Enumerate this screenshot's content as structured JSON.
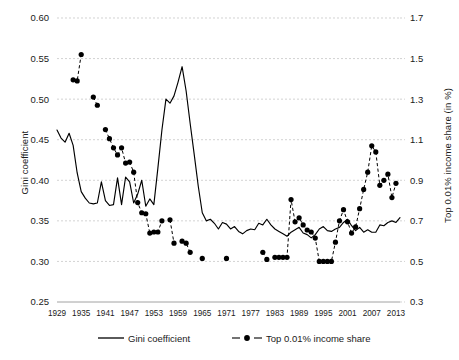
{
  "chart_data": {
    "type": "line",
    "title": "",
    "subtitle": "",
    "xlabel": "",
    "ylabel": "Gini coefficient",
    "ylabel_right": "Top 0.01% income share (in %)",
    "grid": true,
    "legend_position": "bottom",
    "xlim": [
      1929,
      2014
    ],
    "ylim": [
      0.25,
      0.6
    ],
    "ylim_right": [
      0.3,
      1.7
    ],
    "ytick_labels": [
      "0.25",
      "0.30",
      "0.35",
      "0.40",
      "0.45",
      "0.50",
      "0.55",
      "0.60"
    ],
    "ytick_values": [
      0.25,
      0.3,
      0.35,
      0.4,
      0.45,
      0.5,
      0.55,
      0.6
    ],
    "ytick_right_labels": [
      "0.3",
      "0.5",
      "0.7",
      "0.9",
      "1.1",
      "1.3",
      "1.5",
      "1.7"
    ],
    "ytick_right_values": [
      0.3,
      0.5,
      0.7,
      0.9,
      1.1,
      1.3,
      1.5,
      1.7
    ],
    "xtick_labels": [
      "1929",
      "1935",
      "1941",
      "1947",
      "1953",
      "1959",
      "1965",
      "1971",
      "1977",
      "1983",
      "1989",
      "1995",
      "2001",
      "2007",
      "2013"
    ],
    "xtick_values": [
      1929,
      1935,
      1941,
      1947,
      1953,
      1959,
      1965,
      1971,
      1977,
      1983,
      1989,
      1995,
      2001,
      2007,
      2013
    ],
    "series": [
      {
        "name": "Gini coefficient",
        "axis": "left",
        "style": "solid-line",
        "color": "#000000",
        "x": [
          1929,
          1930,
          1931,
          1932,
          1933,
          1934,
          1935,
          1936,
          1937,
          1938,
          1939,
          1940,
          1941,
          1942,
          1943,
          1944,
          1945,
          1946,
          1947,
          1948,
          1949,
          1950,
          1951,
          1952,
          1953,
          1954,
          1955,
          1956,
          1957,
          1958,
          1959,
          1960,
          1961,
          1962,
          1963,
          1964,
          1965,
          1966,
          1967,
          1968,
          1969,
          1970,
          1971,
          1972,
          1973,
          1974,
          1975,
          1976,
          1977,
          1978,
          1979,
          1980,
          1981,
          1982,
          1983,
          1984,
          1985,
          1986,
          1987,
          1988,
          1989,
          1990,
          1991,
          1992,
          1993,
          1994,
          1995,
          1996,
          1997,
          1998,
          1999,
          2000,
          2001,
          2002,
          2003,
          2004,
          2005,
          2006,
          2007,
          2008,
          2009,
          2010,
          2011,
          2012,
          2013,
          2014
        ],
        "values": [
          0.462,
          0.452,
          0.447,
          0.458,
          0.443,
          0.409,
          0.386,
          0.378,
          0.372,
          0.371,
          0.372,
          0.398,
          0.375,
          0.369,
          0.37,
          0.403,
          0.37,
          0.404,
          0.398,
          0.372,
          0.383,
          0.4,
          0.368,
          0.377,
          0.37,
          0.415,
          0.462,
          0.5,
          0.495,
          0.504,
          0.521,
          0.54,
          0.51,
          0.47,
          0.432,
          0.393,
          0.36,
          0.35,
          0.352,
          0.347,
          0.34,
          0.348,
          0.346,
          0.34,
          0.343,
          0.337,
          0.334,
          0.338,
          0.34,
          0.339,
          0.347,
          0.345,
          0.352,
          0.345,
          0.34,
          0.337,
          0.334,
          0.331,
          0.336,
          0.339,
          0.342,
          0.335,
          0.333,
          0.329,
          0.333,
          0.34,
          0.343,
          0.338,
          0.337,
          0.34,
          0.342,
          0.348,
          0.352,
          0.344,
          0.338,
          0.342,
          0.336,
          0.339,
          0.336,
          0.336,
          0.345,
          0.344,
          0.348,
          0.35,
          0.348,
          0.354
        ]
      },
      {
        "name": "Top 0.01% income share",
        "axis": "right",
        "style": "dashed-line-markers",
        "color": "#000000",
        "x": [
          1933,
          1934,
          1935,
          1938,
          1939,
          1941,
          1942,
          1943,
          1944,
          1945,
          1946,
          1947,
          1948,
          1949,
          1950,
          1951,
          1952,
          1953,
          1954,
          1955,
          1957,
          1958,
          1960,
          1961,
          1962,
          1965,
          1971,
          1980,
          1981,
          1983,
          1984,
          1985,
          1986,
          1987,
          1988,
          1989,
          1990,
          1991,
          1992,
          1993,
          1994,
          1995,
          1996,
          1997,
          1998,
          1999,
          2000,
          2001,
          2002,
          2003,
          2004,
          2005,
          2006,
          2007,
          2008,
          2009,
          2010,
          2011,
          2012,
          2013
        ],
        "values": [
          1.395,
          1.39,
          1.52,
          1.31,
          1.27,
          1.15,
          1.105,
          1.06,
          1.025,
          1.06,
          0.985,
          0.99,
          0.94,
          0.79,
          0.74,
          0.735,
          0.64,
          0.645,
          0.645,
          0.7,
          0.705,
          0.59,
          0.6,
          0.59,
          0.545,
          0.515,
          0.515,
          0.545,
          0.51,
          0.52,
          0.52,
          0.52,
          0.52,
          0.805,
          0.695,
          0.715,
          0.68,
          0.655,
          0.645,
          0.615,
          0.5,
          0.5,
          0.5,
          0.5,
          0.595,
          0.7,
          0.755,
          0.695,
          0.64,
          0.67,
          0.76,
          0.855,
          0.94,
          1.07,
          1.04,
          0.875,
          0.9,
          0.93,
          0.815,
          0.885
        ]
      }
    ],
    "legend": [
      {
        "label": "Gini coefficient",
        "style": "solid-line"
      },
      {
        "label": "Top 0.01% income share",
        "style": "dashed-line-markers"
      }
    ]
  }
}
